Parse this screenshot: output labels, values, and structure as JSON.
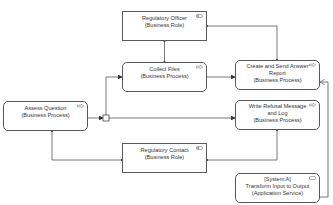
{
  "diagram": {
    "type": "ArchiMate business process view",
    "colors": {
      "line": "#5a5a5a",
      "fill": "#ffffff",
      "text": "#333333"
    },
    "nodes": [
      {
        "id": "regulatory-officer",
        "lines": [
          "Regulatory Officer",
          "(Business Role)"
        ],
        "kind": "role",
        "icon": "business-role-icon"
      },
      {
        "id": "collect-files",
        "lines": [
          "Collect Files",
          "(Business Process)"
        ],
        "kind": "process",
        "icon": "business-process-arrow-icon"
      },
      {
        "id": "create-send-answer-report",
        "lines": [
          "Create and Send Answer",
          "Report",
          "(Business Process)"
        ],
        "kind": "process",
        "icon": "business-process-arrow-icon"
      },
      {
        "id": "assess-question",
        "lines": [
          "Assess Question",
          "(Business Process)"
        ],
        "kind": "process",
        "icon": "business-process-arrow-icon"
      },
      {
        "id": "write-refusal-message",
        "lines": [
          "Write Refusal Message",
          "and Log",
          "(Business Process)"
        ],
        "kind": "process",
        "icon": "business-process-arrow-icon"
      },
      {
        "id": "regulatory-contact",
        "lines": [
          "Regulatory Contact",
          "(Business Role)"
        ],
        "kind": "role",
        "icon": "business-role-icon"
      },
      {
        "id": "transform-input-output",
        "lines": [
          "[System A]",
          "Transform Input to Output",
          "(Application Service)"
        ],
        "kind": "service",
        "icon": "application-service-icon"
      }
    ],
    "edges": [
      {
        "from": "regulatory-officer",
        "to": "collect-files",
        "type": "assignment"
      },
      {
        "from": "regulatory-officer",
        "to": "create-send-answer-report",
        "type": "assignment"
      },
      {
        "from": "assess-question",
        "to": "junction",
        "type": "triggering"
      },
      {
        "from": "junction",
        "to": "collect-files",
        "type": "triggering"
      },
      {
        "from": "junction",
        "to": "write-refusal-message",
        "type": "triggering"
      },
      {
        "from": "collect-files",
        "to": "create-send-answer-report",
        "type": "triggering"
      },
      {
        "from": "assess-question",
        "to": "regulatory-contact",
        "type": "assignment"
      },
      {
        "from": "write-refusal-message",
        "to": "regulatory-contact",
        "type": "assignment"
      },
      {
        "from": "transform-input-output",
        "to": "create-send-answer-report",
        "type": "serving"
      }
    ],
    "junction": {
      "kind": "or-junction"
    }
  }
}
